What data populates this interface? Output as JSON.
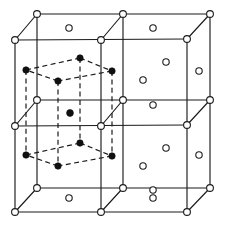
{
  "figure": {
    "caption": "",
    "width": 225,
    "height": 227,
    "background_color": "#ffffff",
    "line_color": "#1b1b1b",
    "open_atom_fill": "#ffffff",
    "filled_atom_fill": "#101010"
  },
  "geometry": {
    "projection": "oblique",
    "cube_origin_front_top_left": [
      15,
      40
    ],
    "cell_edge_px": 86,
    "depth_offset": [
      22,
      -26
    ],
    "cells_across": 2,
    "cells_down": 2
  },
  "chart_data": {
    "type": "scatter",
    "xlabel": "",
    "ylabel": "",
    "series": [
      {
        "name": "lattice-corner-atoms",
        "marker": "open-circle",
        "radius": 3.4,
        "points": [
          [
            15,
            40
          ],
          [
            101,
            40
          ],
          [
            187,
            39
          ],
          [
            15,
            126
          ],
          [
            101,
            126
          ],
          [
            187,
            125
          ],
          [
            15,
            212
          ],
          [
            101,
            212
          ],
          [
            187,
            212
          ],
          [
            37,
            14
          ],
          [
            123,
            14
          ],
          [
            210,
            14
          ],
          [
            37,
            100
          ],
          [
            123,
            100
          ],
          [
            210,
            100
          ],
          [
            37,
            188
          ],
          [
            123,
            188
          ],
          [
            210,
            188
          ]
        ]
      },
      {
        "name": "face-centre-atoms",
        "marker": "open-circle",
        "radius": 3.2,
        "points": [
          [
            69,
            28
          ],
          [
            153,
            28
          ],
          [
            69,
            198
          ],
          [
            153,
            198
          ],
          [
            199,
            71
          ],
          [
            199,
            155
          ],
          [
            143,
            80
          ],
          [
            143,
            166
          ],
          [
            166,
            62
          ],
          [
            166,
            148
          ],
          [
            153,
            105
          ],
          [
            153,
            190
          ]
        ]
      },
      {
        "name": "inner-cell-corner-atoms",
        "marker": "filled-circle",
        "radius": 3.2,
        "points": [
          [
            26,
            70
          ],
          [
            80,
            58
          ],
          [
            112,
            71
          ],
          [
            58,
            81
          ],
          [
            26,
            155
          ],
          [
            80,
            143
          ],
          [
            112,
            156
          ],
          [
            58,
            166
          ]
        ]
      },
      {
        "name": "inner-cell-body-centre-atom",
        "marker": "filled-circle",
        "radius": 3.4,
        "points": [
          [
            70,
            113
          ]
        ]
      }
    ],
    "edges_solid": [
      [
        [
          15,
          40
        ],
        [
          187,
          39
        ]
      ],
      [
        [
          15,
          126
        ],
        [
          187,
          125
        ]
      ],
      [
        [
          15,
          212
        ],
        [
          187,
          212
        ]
      ],
      [
        [
          37,
          14
        ],
        [
          210,
          14
        ]
      ],
      [
        [
          37,
          100
        ],
        [
          210,
          100
        ]
      ],
      [
        [
          37,
          188
        ],
        [
          210,
          188
        ]
      ],
      [
        [
          15,
          40
        ],
        [
          15,
          212
        ]
      ],
      [
        [
          101,
          40
        ],
        [
          101,
          212
        ]
      ],
      [
        [
          187,
          39
        ],
        [
          187,
          212
        ]
      ],
      [
        [
          37,
          14
        ],
        [
          37,
          188
        ]
      ],
      [
        [
          123,
          14
        ],
        [
          123,
          188
        ]
      ],
      [
        [
          210,
          14
        ],
        [
          210,
          188
        ]
      ],
      [
        [
          15,
          40
        ],
        [
          37,
          14
        ]
      ],
      [
        [
          101,
          40
        ],
        [
          123,
          14
        ]
      ],
      [
        [
          187,
          39
        ],
        [
          210,
          14
        ]
      ],
      [
        [
          15,
          126
        ],
        [
          37,
          100
        ]
      ],
      [
        [
          101,
          126
        ],
        [
          123,
          100
        ]
      ],
      [
        [
          187,
          125
        ],
        [
          210,
          100
        ]
      ],
      [
        [
          15,
          212
        ],
        [
          37,
          188
        ]
      ],
      [
        [
          101,
          212
        ],
        [
          123,
          188
        ]
      ],
      [
        [
          187,
          212
        ],
        [
          210,
          188
        ]
      ]
    ],
    "edges_dashed": [
      [
        [
          26,
          70
        ],
        [
          80,
          58
        ]
      ],
      [
        [
          80,
          58
        ],
        [
          112,
          71
        ]
      ],
      [
        [
          112,
          71
        ],
        [
          58,
          81
        ]
      ],
      [
        [
          58,
          81
        ],
        [
          26,
          70
        ]
      ],
      [
        [
          26,
          155
        ],
        [
          80,
          143
        ]
      ],
      [
        [
          80,
          143
        ],
        [
          112,
          156
        ]
      ],
      [
        [
          112,
          156
        ],
        [
          58,
          166
        ]
      ],
      [
        [
          58,
          166
        ],
        [
          26,
          155
        ]
      ],
      [
        [
          26,
          70
        ],
        [
          26,
          155
        ]
      ],
      [
        [
          80,
          58
        ],
        [
          80,
          143
        ]
      ],
      [
        [
          112,
          71
        ],
        [
          112,
          156
        ]
      ],
      [
        [
          58,
          81
        ],
        [
          58,
          166
        ]
      ]
    ],
    "legend": {
      "position": "none",
      "entries": [
        {
          "label": "cubic lattice site (open circle)",
          "marker": "open-circle"
        },
        {
          "label": "tetragonal cell site (filled circle)",
          "marker": "filled-circle"
        }
      ]
    },
    "grid": false
  }
}
